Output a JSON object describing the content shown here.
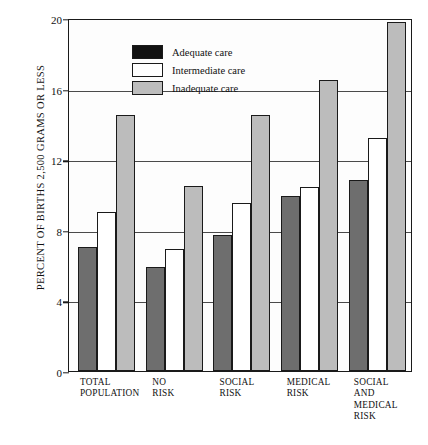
{
  "chart_data": {
    "type": "bar",
    "title": "",
    "xlabel": "",
    "ylabel": "PERCENT OF BIRTHS 2,500 GRAMS OR LESS",
    "ylim": [
      0,
      20
    ],
    "yticks": [
      0,
      4,
      8,
      12,
      16,
      20
    ],
    "grid": true,
    "legend_position": "top-left",
    "categories": [
      "TOTAL POPULATION",
      "NO RISK",
      "SOCIAL RISK",
      "MEDICAL RISK",
      "SOCIAL AND MEDICAL RISK"
    ],
    "series": [
      {
        "name": "Adequate care",
        "color": "#121212",
        "values": [
          7.0,
          5.9,
          7.7,
          9.9,
          10.8
        ]
      },
      {
        "name": "Intermediate care",
        "color": "#ffffff",
        "values": [
          9.0,
          6.9,
          9.5,
          10.4,
          13.2
        ]
      },
      {
        "name": "Inadequate care",
        "color": "#bdbdbd",
        "values": [
          14.5,
          10.5,
          14.5,
          16.5,
          19.8
        ]
      }
    ]
  },
  "axis": {
    "y_title": "PERCENT OF BIRTHS 2,500 GRAMS OR LESS",
    "tick_20": "20",
    "tick_16": "16",
    "tick_12": "12",
    "tick_8": "8",
    "tick_4": "4",
    "tick_0": "0"
  },
  "legend": {
    "items": [
      {
        "label": "Adequate care"
      },
      {
        "label": "Intermediate care"
      },
      {
        "label": "Inadequate care"
      }
    ]
  },
  "xlabels": [
    {
      "line1": "TOTAL",
      "line2": "POPULATION",
      "line3": ""
    },
    {
      "line1": "NO",
      "line2": "RISK",
      "line3": ""
    },
    {
      "line1": "SOCIAL",
      "line2": "RISK",
      "line3": ""
    },
    {
      "line1": "MEDICAL",
      "line2": "RISK",
      "line3": ""
    },
    {
      "line1": "SOCIAL AND",
      "line2": "MEDICAL",
      "line3": "RISK"
    }
  ]
}
